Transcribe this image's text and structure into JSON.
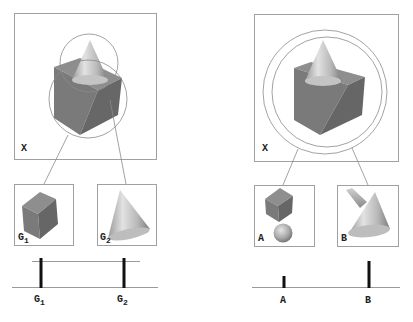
{
  "left_panel": {
    "scene_label": "X",
    "thumbnails": [
      {
        "label": "G",
        "subscript": "1",
        "shape": "cube"
      },
      {
        "label": "G",
        "subscript": "2",
        "shape": "cone"
      }
    ],
    "axis": {
      "ticks": [
        {
          "label": "G",
          "subscript": "1",
          "height": "tall"
        },
        {
          "label": "G",
          "subscript": "2",
          "height": "tall"
        }
      ],
      "has_upper_line": true
    }
  },
  "right_panel": {
    "scene_label": "X",
    "thumbnails": [
      {
        "label": "A",
        "shape": "cube-with-sphere"
      },
      {
        "label": "B",
        "shape": "cone-with-cylinder"
      }
    ],
    "axis": {
      "ticks": [
        {
          "label": "A",
          "height": "short"
        },
        {
          "label": "B",
          "height": "tall"
        }
      ],
      "has_upper_line": false
    }
  },
  "colors": {
    "frame": "#a0a0a0",
    "bar": "#111111",
    "cube_front": "#7a7a7a",
    "cube_side": "#6a6a6a",
    "cube_top": "#8e8e8e",
    "cone_light": "#d8d8d8",
    "cone_dark": "#8a8a8a"
  }
}
